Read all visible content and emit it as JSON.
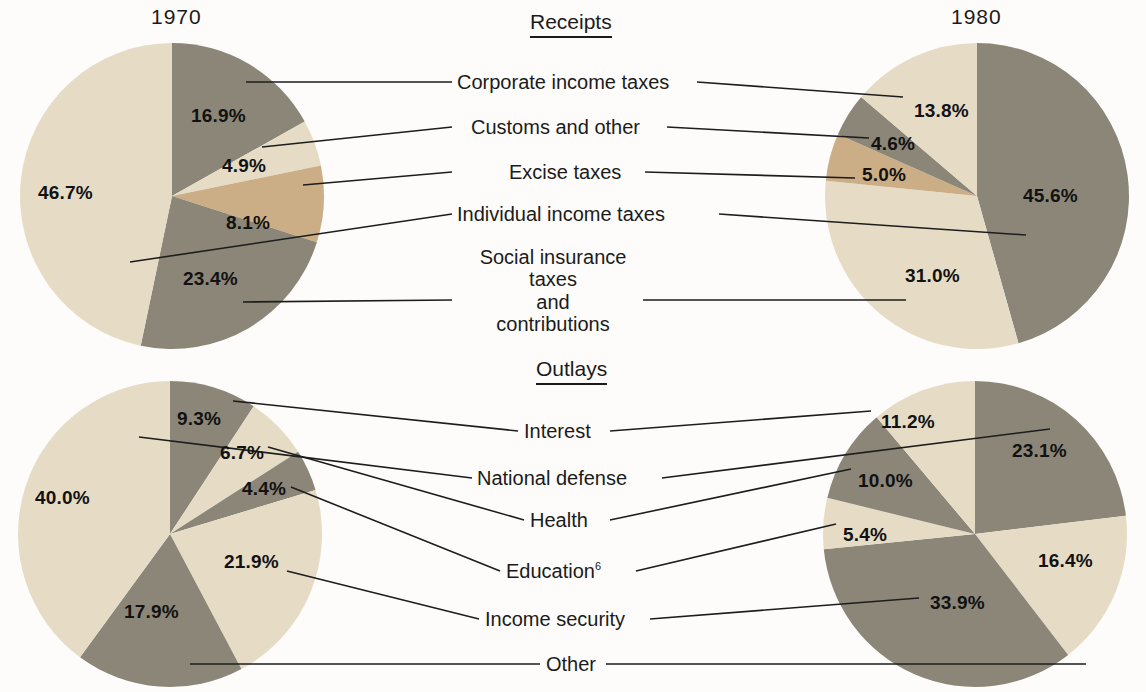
{
  "figure": {
    "background": "#fdfcfa",
    "colors": {
      "cream": "#e6dcc6",
      "gray": "#8b8678",
      "tan": "#ccae86",
      "ink": "#1b1b1b"
    },
    "years": {
      "left": "1970",
      "right": "1980"
    },
    "sections": {
      "receipts": "Receipts",
      "outlays": "Outlays"
    }
  },
  "receipts": {
    "title": "Receipts",
    "labels": [
      "Corporate income taxes",
      "Customs and other",
      "Excise taxes",
      "Individual income taxes",
      "Social insurance taxes\nand\ncontributions"
    ],
    "y1970": {
      "Corporate income taxes": "16.9%",
      "Customs and other": "4.9%",
      "Excise taxes": "8.1%",
      "Social insurance taxes and contributions": "23.4%",
      "Individual income taxes": "46.7%"
    },
    "y1980": {
      "Individual income taxes": "45.6%",
      "Social insurance taxes and contributions": "31.0%",
      "Excise taxes": "5.0%",
      "Customs and other": "4.6%",
      "Corporate income taxes": "13.8%"
    }
  },
  "outlays": {
    "title": "Outlays",
    "labels": [
      "Interest",
      "National defense",
      "Health",
      "Education",
      "Income security",
      "Other"
    ],
    "education_footnote": "6",
    "y1970": {
      "Interest": "9.3%",
      "Health": "6.7%",
      "Education": "4.4%",
      "Income security": "21.9%",
      "Other": "17.9%",
      "National defense": "40.0%"
    },
    "y1980": {
      "National defense": "23.1%",
      "Other": "16.4%",
      "Income security": "33.9%",
      "Education": "5.4%",
      "Health": "10.0%",
      "Interest": "11.2%"
    }
  },
  "chart_data": [
    {
      "type": "pie",
      "title": "Receipts 1970",
      "labels": [
        "Corporate income taxes",
        "Customs and other",
        "Excise taxes",
        "Social insurance taxes and contributions",
        "Individual income taxes"
      ],
      "values": [
        16.9,
        4.9,
        8.1,
        23.4,
        46.7
      ],
      "colors": [
        "#8b8678",
        "#e6dcc6",
        "#ccae86",
        "#8b8678",
        "#e6dcc6"
      ],
      "start_angle_deg": 0,
      "direction": "clockwise"
    },
    {
      "type": "pie",
      "title": "Receipts 1980",
      "labels": [
        "Individual income taxes",
        "Social insurance taxes and contributions",
        "Excise taxes",
        "Customs and other",
        "Corporate income taxes"
      ],
      "values": [
        45.6,
        31.0,
        5.0,
        4.6,
        13.8
      ],
      "colors": [
        "#8b8678",
        "#e6dcc6",
        "#ccae86",
        "#8b8678",
        "#e6dcc6"
      ],
      "start_angle_deg": 0,
      "direction": "clockwise"
    },
    {
      "type": "pie",
      "title": "Outlays 1970",
      "labels": [
        "Interest",
        "Health",
        "Education",
        "Income security",
        "Other",
        "National defense"
      ],
      "values": [
        9.3,
        6.7,
        4.4,
        21.9,
        17.9,
        40.0
      ],
      "colors": [
        "#8b8678",
        "#e6dcc6",
        "#8b8678",
        "#e6dcc6",
        "#8b8678",
        "#e6dcc6"
      ],
      "start_angle_deg": 0,
      "direction": "clockwise"
    },
    {
      "type": "pie",
      "title": "Outlays 1980",
      "labels": [
        "National defense",
        "Other",
        "Income security",
        "Education",
        "Health",
        "Interest"
      ],
      "values": [
        23.1,
        16.4,
        33.9,
        5.4,
        10.0,
        11.2
      ],
      "colors": [
        "#8b8678",
        "#e6dcc6",
        "#8b8678",
        "#e6dcc6",
        "#8b8678",
        "#e6dcc6"
      ],
      "start_angle_deg": 0,
      "direction": "clockwise"
    }
  ]
}
